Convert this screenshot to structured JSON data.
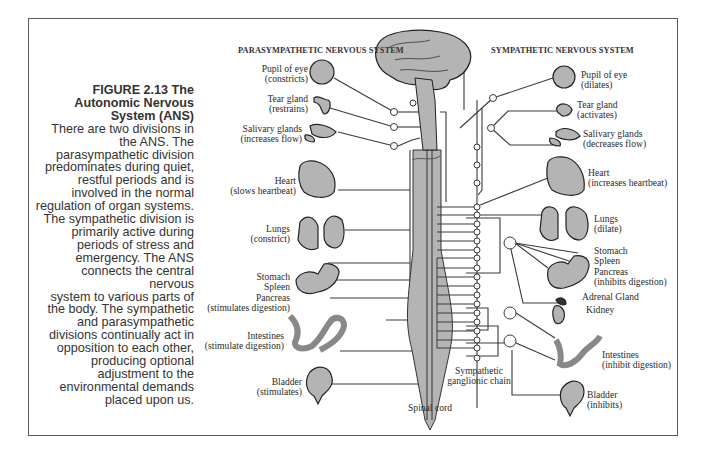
{
  "caption": {
    "figure": "FIGURE 2.13   The",
    "title_line2": "Autonomic Nervous",
    "title_line3": "System (ANS)",
    "body_lines": [
      "There are two divisions in",
      "the ANS. The",
      "parasympathetic division",
      "predominates during quiet,",
      "restful periods and is",
      "involved in the normal",
      "regulation of organ systems.",
      "The sympathetic division is",
      "primarily active during",
      "periods of stress and",
      "emergency. The ANS",
      "connects the central nervous",
      "system to various parts of",
      "the body. The sympathetic",
      "and parasympathetic",
      "divisions continually act in",
      "opposition to each other,",
      "producing optional",
      "adjustment to the",
      "environmental demands",
      "placed upon us."
    ]
  },
  "headers": {
    "parasympathetic": "PARASYMPATHETIC NERVOUS SYSTEM",
    "sympathetic": "SYMPATHETIC NERVOUS SYSTEM"
  },
  "parasympathetic_labels": [
    {
      "organ": "Pupil of eye",
      "effect": "(constricts)"
    },
    {
      "organ": "Tear gland",
      "effect": "(restrains)"
    },
    {
      "organ": "Salivary glands",
      "effect": "(increases flow)"
    },
    {
      "organ": "Heart",
      "effect": "(slows heartbeat)"
    },
    {
      "organ": "Lungs",
      "effect": "(constrict)"
    },
    {
      "organ": "Stomach",
      "organ2": "Spleen",
      "organ3": "Pancreas",
      "effect": "(stimulates digestion)"
    },
    {
      "organ": "Intestines",
      "effect": "(stimulate digestion)"
    },
    {
      "organ": "Bladder",
      "effect": "(stimulates)"
    }
  ],
  "sympathetic_labels": [
    {
      "organ": "Pupil of eye",
      "effect": "(dilates)"
    },
    {
      "organ": "Tear gland",
      "effect": "(activates)"
    },
    {
      "organ": "Salivary glands",
      "effect": "(decreases flow)"
    },
    {
      "organ": "Heart",
      "effect": "(increases heartbeat)"
    },
    {
      "organ": "Lungs",
      "effect": "(dilate)"
    },
    {
      "organ": "Stomach",
      "organ2": "Spleen",
      "organ3": "Pancreas",
      "effect": "(inhibits digestion)"
    },
    {
      "organ": "Adrenal Gland"
    },
    {
      "organ": "Kidney"
    },
    {
      "organ": "Intestines",
      "effect": "(inhibit digestion)"
    },
    {
      "organ": "Bladder",
      "effect": "(inhibits)"
    }
  ],
  "center_labels": {
    "spinal_cord": "Spinal cord",
    "chain_line1": "Sympathetic",
    "chain_line2": "ganglionic chain"
  },
  "colors": {
    "organ_fill": "#b4b4b4",
    "line": "#3a3a3a",
    "frame": "#5a5a5a"
  }
}
